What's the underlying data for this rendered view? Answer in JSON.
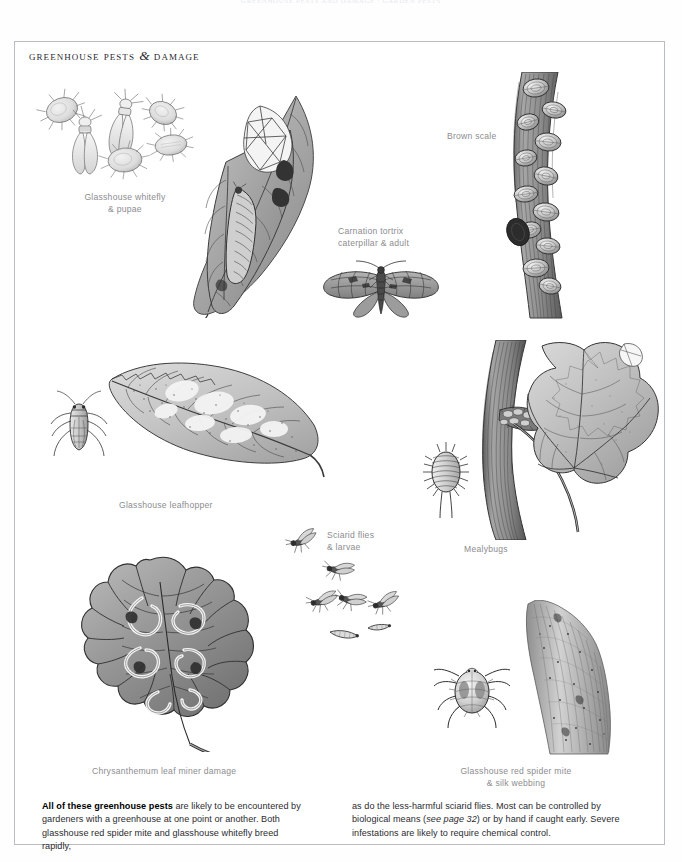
{
  "running_head": "GREENHOUSE PESTS AND DAMAGE · GARDEN PESTS",
  "page": {
    "title_text": "Greenhouse Pests",
    "title_amp": "&",
    "title_text2": "Damage"
  },
  "captions": [
    {
      "name": "whitefly",
      "line1": "Glasshouse whitefly",
      "line2": "& pupae"
    },
    {
      "name": "brown-scale",
      "line1": "Brown scale",
      "line2": ""
    },
    {
      "name": "carnation-tortrix",
      "line1": "Carnation tortrix",
      "line2": "caterpillar & adult"
    },
    {
      "name": "leafhopper",
      "line1": "Glasshouse leafhopper",
      "line2": ""
    },
    {
      "name": "sciarid-flies",
      "line1": "Sciarid flies",
      "line2": "& larvae"
    },
    {
      "name": "mealybugs",
      "line1": "Mealybugs",
      "line2": ""
    },
    {
      "name": "leaf-miner",
      "line1": "Chrysanthemum leaf miner damage",
      "line2": ""
    },
    {
      "name": "red-spider-mite",
      "line1": "Glasshouse red spider mite",
      "line2": "& silk webbing"
    }
  ],
  "body": {
    "left_lead": "All of these greenhouse pests",
    "left_rest": " are likely to be encountered by gardeners with a greenhouse at one point or another. Both glasshouse red spider mite and glasshouse whitefly breed rapidly,",
    "right_a": "as do the less-harmful sciarid flies. Most can be controlled by biological means (",
    "right_italic": "see page 32",
    "right_b": ") or by hand if caught early. Severe infestations are likely to require chemical control."
  },
  "colors": {
    "ink": "#2b2b2f",
    "caption_grey": "#8c8c90",
    "frame_grey": "#b9bcc4",
    "paper": "#ffffff",
    "illo_mid": "#9a9a9a",
    "illo_dark": "#3c3c3c",
    "illo_light": "#d6d6d6"
  },
  "illustrations": [
    {
      "name": "glasshouse-whitefly-and-pupae-illustration"
    },
    {
      "name": "carnation-tortrix-caterpillar-on-leaf-illustration"
    },
    {
      "name": "carnation-tortrix-adult-moth-illustration"
    },
    {
      "name": "brown-scale-on-stem-illustration"
    },
    {
      "name": "glasshouse-leafhopper-illustration"
    },
    {
      "name": "leafhopper-damaged-leaf-illustration"
    },
    {
      "name": "mealybug-illustration"
    },
    {
      "name": "mealybugs-on-vine-stem-and-grape-leaf-illustration"
    },
    {
      "name": "sciarid-flies-and-larvae-illustration"
    },
    {
      "name": "chrysanthemum-leaf-miner-damage-illustration"
    },
    {
      "name": "glasshouse-red-spider-mite-illustration"
    },
    {
      "name": "silk-webbing-on-shoot-illustration"
    }
  ]
}
